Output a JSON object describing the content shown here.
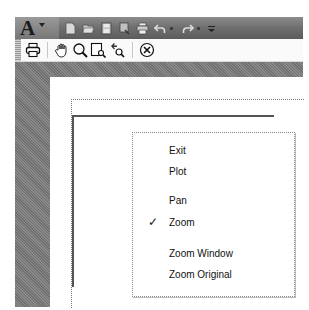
{
  "quick_access_toolbar": {
    "app_logo": "A",
    "buttons": [
      {
        "name": "new-icon"
      },
      {
        "name": "open-icon"
      },
      {
        "name": "save-icon"
      },
      {
        "name": "save-as-icon"
      },
      {
        "name": "print-icon"
      },
      {
        "name": "undo-icon"
      },
      {
        "name": "redo-icon"
      },
      {
        "name": "customize-qat-icon"
      }
    ]
  },
  "plot_preview_toolbar": {
    "buttons": [
      {
        "name": "plot-icon"
      },
      {
        "name": "pan-icon"
      },
      {
        "name": "zoom-icon"
      },
      {
        "name": "zoom-window-icon"
      },
      {
        "name": "zoom-original-icon"
      },
      {
        "name": "close-preview-icon"
      }
    ]
  },
  "context_menu": {
    "items": [
      {
        "label": "Exit",
        "checked": false
      },
      {
        "label": "Plot",
        "checked": false
      },
      {
        "label": "Pan",
        "checked": false
      },
      {
        "label": "Zoom",
        "checked": true,
        "check_glyph": "✓"
      },
      {
        "label": "Zoom Window",
        "checked": false
      },
      {
        "label": "Zoom Original",
        "checked": false
      }
    ]
  }
}
